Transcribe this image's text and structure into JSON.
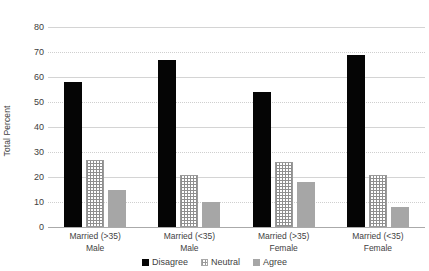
{
  "chart_data": {
    "type": "bar",
    "title": "",
    "xlabel": "",
    "ylabel": "Total Percent",
    "ylim": [
      0,
      80
    ],
    "yticks": [
      0,
      10,
      20,
      30,
      40,
      50,
      60,
      70,
      80
    ],
    "ytick_labels": [
      "0",
      "10",
      "20",
      "30",
      "40",
      "50",
      "60",
      "70",
      "80"
    ],
    "grid": true,
    "legend_position": "bottom",
    "categories": [
      "Married (>35) Male",
      "Married (<35) Male",
      "Married (>35) Female",
      "Married (<35) Female"
    ],
    "category_lines": [
      {
        "line1": "Married (>35)",
        "line2": "Male"
      },
      {
        "line1": "Married (<35)",
        "line2": "Male"
      },
      {
        "line1": "Married (>35)",
        "line2": "Female"
      },
      {
        "line1": "Married (<35)",
        "line2": "Female"
      }
    ],
    "series": [
      {
        "name": "Disagree",
        "color": "#050505",
        "values": [
          58,
          67,
          54,
          69
        ]
      },
      {
        "name": "Neutral",
        "color": "#ffffff",
        "values": [
          27,
          21,
          26,
          21
        ]
      },
      {
        "name": "Agree",
        "color": "#a6a6a6",
        "values": [
          15,
          10,
          18,
          8
        ]
      }
    ]
  },
  "legend": {
    "items": [
      {
        "label": "Disagree"
      },
      {
        "label": "Neutral"
      },
      {
        "label": "Agree"
      }
    ]
  }
}
